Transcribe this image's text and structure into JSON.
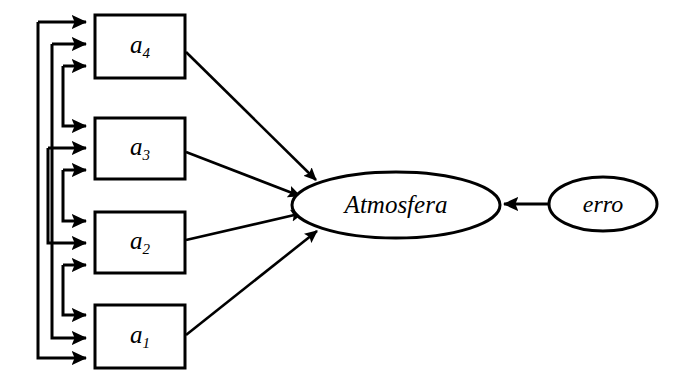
{
  "diagram": {
    "type": "path-diagram",
    "background_color": "#ffffff",
    "line_color": "#000000",
    "fill_color": "#ffffff",
    "indicators": [
      {
        "id": "a4",
        "base": "a",
        "subscript": "4",
        "label": "a4",
        "x": 95,
        "y": 15,
        "w": 90,
        "h": 63
      },
      {
        "id": "a3",
        "base": "a",
        "subscript": "3",
        "label": "a3",
        "x": 95,
        "y": 118,
        "w": 90,
        "h": 61
      },
      {
        "id": "a2",
        "base": "a",
        "subscript": "2",
        "label": "a2",
        "x": 95,
        "y": 212,
        "w": 90,
        "h": 61
      },
      {
        "id": "a1",
        "base": "a",
        "subscript": "1",
        "label": "a1",
        "x": 95,
        "y": 305,
        "w": 90,
        "h": 63
      }
    ],
    "latents": [
      {
        "id": "atmosfera",
        "label": "Atmosfera",
        "cx": 396,
        "cy": 205,
        "rx": 104,
        "ry": 33
      },
      {
        "id": "erro",
        "label": "erro",
        "cx": 603,
        "cy": 204,
        "rx": 54,
        "ry": 27
      }
    ],
    "edges": [
      {
        "from": "a4",
        "to": "atmosfera",
        "kind": "loading"
      },
      {
        "from": "a3",
        "to": "atmosfera",
        "kind": "loading"
      },
      {
        "from": "a2",
        "to": "atmosfera",
        "kind": "loading"
      },
      {
        "from": "a1",
        "to": "atmosfera",
        "kind": "loading"
      },
      {
        "from": "erro",
        "to": "atmosfera",
        "kind": "error-term"
      }
    ],
    "correlation_count": 12,
    "correlation_note": "three incoming bracket arrows per indicator box"
  }
}
